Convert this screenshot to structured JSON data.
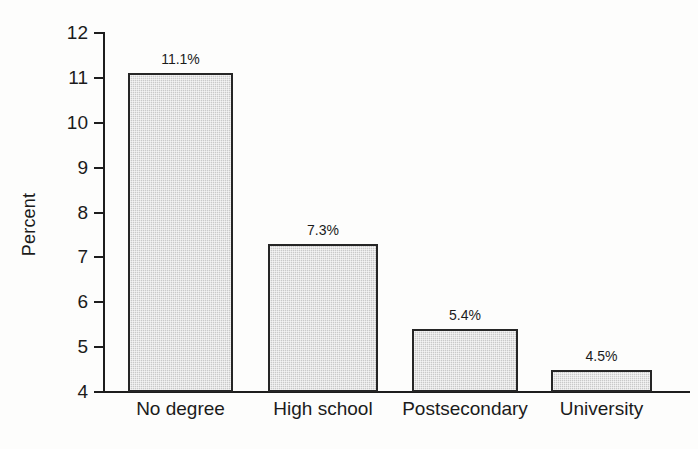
{
  "chart_data": {
    "type": "bar",
    "title": "",
    "xlabel": "",
    "ylabel": "Percent",
    "categories": [
      "No degree",
      "High school",
      "Postsecondary",
      "University"
    ],
    "values": [
      11.1,
      7.3,
      5.4,
      4.5
    ],
    "value_labels": [
      "11.1%",
      "7.3%",
      "5.4%",
      "4.5%"
    ],
    "ylim": [
      4,
      12
    ],
    "yticks": [
      12,
      11,
      10,
      9,
      8,
      7,
      6,
      5,
      4
    ],
    "ytick_labels": [
      "12",
      "11",
      "10",
      "9",
      "8",
      "7",
      "6",
      "5",
      "4"
    ],
    "grid": false,
    "legend": false,
    "bar_fill_color": "#c9c9c9",
    "bar_edge_color": "#262626",
    "background_color": "#fdfdfc",
    "text_color": "#1b1b1b"
  },
  "axis": {
    "y_title": "Percent"
  }
}
